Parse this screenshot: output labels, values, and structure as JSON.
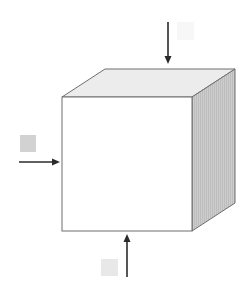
{
  "diagram": {
    "type": "cube-with-force-arrows",
    "colors": {
      "background": "#ffffff",
      "front_face": "#ffffff",
      "top_face": "#ececec",
      "right_face": "#c9c9c9",
      "edge": "#6e6e6e",
      "arrow": "#2b2b2b",
      "label_box_left": "#d2d2d2",
      "label_box_bottom": "#e8e8e8",
      "label_box_top": "#f7f7f7"
    },
    "cube": {
      "front": {
        "x": 62,
        "y": 97,
        "width": 130,
        "height": 134
      },
      "depth_dx": 43,
      "depth_dy": -28
    },
    "arrows": [
      {
        "id": "top",
        "direction": "down",
        "x1": 168,
        "y1": 22,
        "x2": 168,
        "y2": 64,
        "label": ""
      },
      {
        "id": "left",
        "direction": "right",
        "x1": 19,
        "y1": 162,
        "x2": 60,
        "y2": 162,
        "label": ""
      },
      {
        "id": "bottom",
        "direction": "up",
        "x1": 127,
        "y1": 277,
        "x2": 127,
        "y2": 234,
        "label": ""
      }
    ],
    "label_boxes": [
      {
        "id": "top",
        "x": 177,
        "y": 22,
        "width": 17,
        "height": 18,
        "text": ""
      },
      {
        "id": "left",
        "x": 20,
        "y": 135,
        "width": 16,
        "height": 17,
        "text": ""
      },
      {
        "id": "bottom",
        "x": 101,
        "y": 259,
        "width": 17,
        "height": 17,
        "text": ""
      }
    ]
  }
}
